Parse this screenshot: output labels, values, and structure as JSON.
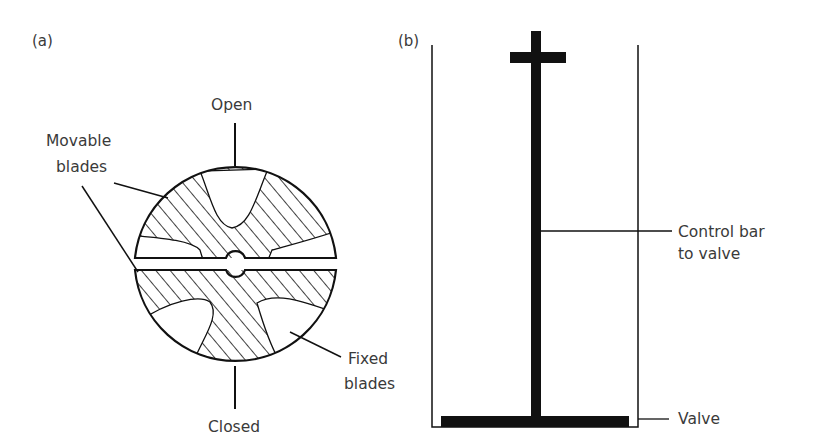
{
  "panel_a": {
    "label": "(a)",
    "open_label": "Open",
    "closed_label": "Closed",
    "movable_blades_label": [
      "Movable",
      "blades"
    ],
    "fixed_blades_label": [
      "Fixed",
      "blades"
    ]
  },
  "panel_b": {
    "label": "(b)",
    "control_bar_label": [
      "Control bar",
      "to valve"
    ],
    "valve_label": "Valve"
  },
  "colors": {
    "line": "#111111",
    "text": "#3a3a3a",
    "background": "#ffffff"
  }
}
